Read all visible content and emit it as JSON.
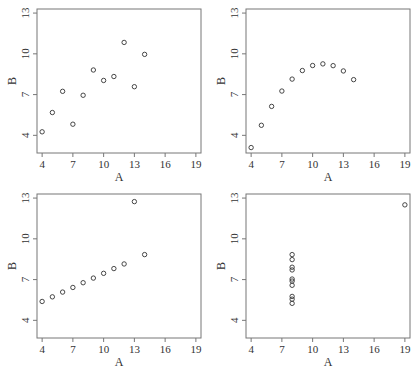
{
  "chart_data": [
    {
      "type": "scatter",
      "title": "",
      "xlabel": "A",
      "ylabel": "B",
      "xlim": [
        3.5,
        19.5
      ],
      "ylim": [
        2.7,
        13.3
      ],
      "xticks": [
        4,
        7,
        10,
        13,
        16,
        19
      ],
      "yticks": [
        4,
        7,
        10,
        13
      ],
      "grid": false,
      "x": [
        10,
        8,
        13,
        9,
        11,
        14,
        6,
        4,
        12,
        7,
        5
      ],
      "y": [
        8.04,
        6.95,
        7.58,
        8.81,
        8.33,
        9.96,
        7.24,
        4.26,
        10.84,
        4.82,
        5.68
      ]
    },
    {
      "type": "scatter",
      "title": "",
      "xlabel": "A",
      "ylabel": "B",
      "xlim": [
        3.5,
        19.5
      ],
      "ylim": [
        2.7,
        13.3
      ],
      "xticks": [
        4,
        7,
        10,
        13,
        16,
        19
      ],
      "yticks": [
        4,
        7,
        10,
        13
      ],
      "grid": false,
      "x": [
        10,
        8,
        13,
        9,
        11,
        14,
        6,
        4,
        12,
        7,
        5
      ],
      "y": [
        9.14,
        8.14,
        8.74,
        8.77,
        9.26,
        8.1,
        6.13,
        3.1,
        9.13,
        7.26,
        4.74
      ]
    },
    {
      "type": "scatter",
      "title": "",
      "xlabel": "A",
      "ylabel": "B",
      "xlim": [
        3.5,
        19.5
      ],
      "ylim": [
        2.7,
        13.3
      ],
      "xticks": [
        4,
        7,
        10,
        13,
        16,
        19
      ],
      "yticks": [
        4,
        7,
        10,
        13
      ],
      "grid": false,
      "x": [
        10,
        8,
        13,
        9,
        11,
        14,
        6,
        4,
        12,
        7,
        5
      ],
      "y": [
        7.46,
        6.77,
        12.74,
        7.11,
        7.81,
        8.84,
        6.08,
        5.39,
        8.15,
        6.42,
        5.73
      ]
    },
    {
      "type": "scatter",
      "title": "",
      "xlabel": "A",
      "ylabel": "B",
      "xlim": [
        3.5,
        19.5
      ],
      "ylim": [
        2.7,
        13.3
      ],
      "xticks": [
        4,
        7,
        10,
        13,
        16,
        19
      ],
      "yticks": [
        4,
        7,
        10,
        13
      ],
      "grid": false,
      "x": [
        8,
        8,
        8,
        8,
        8,
        8,
        8,
        19,
        8,
        8,
        8
      ],
      "y": [
        6.58,
        5.76,
        7.71,
        8.84,
        8.47,
        7.04,
        5.25,
        12.5,
        5.56,
        7.91,
        6.89
      ]
    }
  ],
  "style": {
    "axis_color": "#777777",
    "point_color": "#333333",
    "text_color": "#333333"
  }
}
